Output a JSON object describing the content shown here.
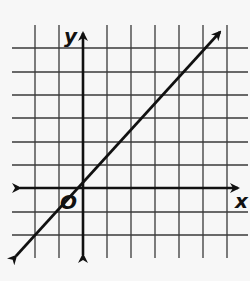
{
  "labels": {
    "x_axis": "x",
    "y_axis": "y",
    "origin": "O"
  },
  "colors": {
    "background": "#f7f7f7",
    "grid": "#3a3a3a",
    "ink": "#111111"
  },
  "graph": {
    "type": "coordinate-plane-line",
    "grid_x_range": [
      -2,
      6
    ],
    "grid_y_range": [
      -2,
      6
    ],
    "line": {
      "slope": 1,
      "y_intercept": 1,
      "x_intercept": -1,
      "equation": "y = x + 1"
    }
  }
}
